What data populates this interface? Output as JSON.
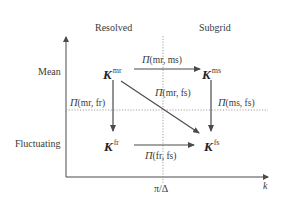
{
  "diagram": {
    "columns": {
      "resolved": "Resolved",
      "subgrid": "Subgrid"
    },
    "rows": {
      "mean": "Mean",
      "fluctuating": "Fluctuating"
    },
    "nodes": {
      "mr": {
        "symbol": "K",
        "sup": "mr"
      },
      "ms": {
        "symbol": "K",
        "sup": "ms"
      },
      "fr": {
        "symbol": "K",
        "sup": "fr"
      },
      "fs": {
        "symbol": "K",
        "sup": "fs"
      }
    },
    "transfers": {
      "mr_ms": {
        "symbol": "Π",
        "args": "(mr, ms)"
      },
      "mr_fr": {
        "symbol": "Π",
        "args": "(mr, fr)"
      },
      "mr_fs": {
        "symbol": "Π",
        "args": "(mr, fs)"
      },
      "ms_fs": {
        "symbol": "Π",
        "args": "(ms, fs)"
      },
      "fr_fs": {
        "symbol": "Π",
        "args": "(fr, fs)"
      }
    },
    "axes": {
      "x_label": "k",
      "cutoff_label": "π/Δ"
    },
    "colors": {
      "line": "#4a4a4a",
      "text": "#3a3a3a",
      "dotted": "#8a8a8a"
    }
  }
}
